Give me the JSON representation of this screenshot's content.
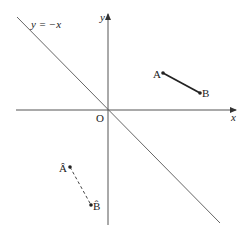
{
  "diagram": {
    "type": "coordinate-geometry-reflection",
    "axes": {
      "x_label": "x",
      "y_label": "y",
      "origin_label": "O"
    },
    "mirror_line": {
      "label": "y = −x",
      "equation": "y = -x"
    },
    "segments": [
      {
        "name": "AB",
        "style": "solid",
        "points": [
          {
            "label": "A",
            "px": [
              163,
              73
            ]
          },
          {
            "label": "B",
            "px": [
              200,
              93
            ]
          }
        ]
      },
      {
        "name": "ÂB̂",
        "style": "dashed",
        "points": [
          {
            "label": "Â",
            "px": [
              70,
              167
            ]
          },
          {
            "label": "B̂",
            "px": [
              91,
              205
            ]
          }
        ]
      }
    ],
    "colors": {
      "axis": "#555555",
      "mirror_line": "#666666",
      "segment": "#222222",
      "text": "#222222"
    }
  }
}
